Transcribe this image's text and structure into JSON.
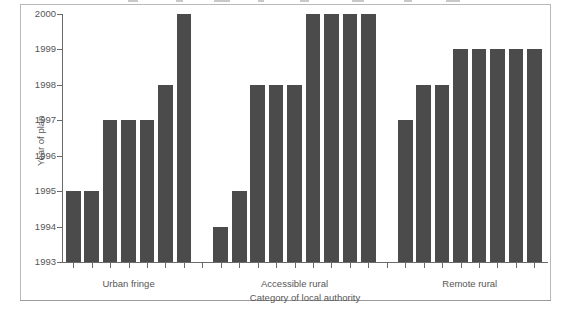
{
  "chart_data": {
    "type": "bar",
    "title": "",
    "xlabel": "Category of local authority",
    "ylabel": "Year of plan",
    "ylim": [
      1993,
      2000
    ],
    "ytick_labels": [
      "1993",
      "1994",
      "1995",
      "1996",
      "1997",
      "1998",
      "1999",
      "2000"
    ],
    "ytick_values": [
      1993,
      1994,
      1995,
      1996,
      1997,
      1998,
      1999,
      2000
    ],
    "grid": false,
    "legend": null,
    "baseline": 1993,
    "groups": [
      {
        "label": "Urban fringe",
        "values": [
          1995,
          1995,
          1997,
          1997,
          1997,
          1998,
          2000
        ]
      },
      {
        "label": "Accessible rural",
        "values": [
          1994,
          1995,
          1998,
          1998,
          1998,
          2000,
          2000,
          2000,
          2000
        ]
      },
      {
        "label": "Remote rural",
        "values": [
          1997,
          1998,
          1998,
          1999,
          1999,
          1999,
          1999,
          1999
        ]
      }
    ],
    "categories": [
      "Urban fringe",
      "Urban fringe",
      "Urban fringe",
      "Urban fringe",
      "Urban fringe",
      "Urban fringe",
      "Urban fringe",
      "Accessible rural",
      "Accessible rural",
      "Accessible rural",
      "Accessible rural",
      "Accessible rural",
      "Accessible rural",
      "Accessible rural",
      "Accessible rural",
      "Accessible rural",
      "Remote rural",
      "Remote rural",
      "Remote rural",
      "Remote rural",
      "Remote rural",
      "Remote rural",
      "Remote rural",
      "Remote rural"
    ],
    "values": [
      1995,
      1995,
      1997,
      1997,
      1997,
      1998,
      2000,
      1994,
      1995,
      1998,
      1998,
      1998,
      2000,
      2000,
      2000,
      2000,
      1997,
      1998,
      1998,
      1999,
      1999,
      1999,
      1999,
      1999
    ],
    "bar_color": "#4b4b4b",
    "axis_color": "#6a6a6a",
    "text_color": "#555555",
    "background": "#ffffff"
  }
}
